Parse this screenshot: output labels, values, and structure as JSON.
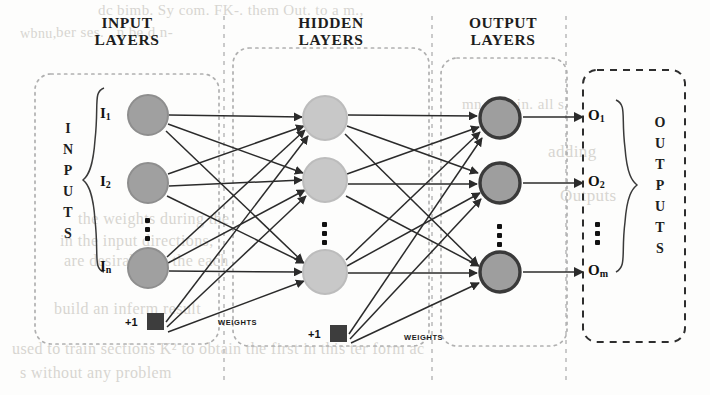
{
  "diagram": {
    "type": "neural-network",
    "background_color": "#fdfdfc",
    "ink_color": "#1d1d1d"
  },
  "headers": {
    "input_layers": "INPUT\nLAYERS",
    "input_layers_line1": "INPUT",
    "input_layers_line2": "LAYERS",
    "hidden_layers_line1": "HIDDEN",
    "hidden_layers_line2": "LAYERS",
    "output_layers_line1": "OUTPUT",
    "output_layers_line2": "LAYERS"
  },
  "sides": {
    "inputs_vertical": [
      "I",
      "N",
      "P",
      "U",
      "T",
      "S"
    ],
    "outputs_vertical": [
      "O",
      "U",
      "T",
      "P",
      "U",
      "T",
      "S"
    ]
  },
  "input_nodes": [
    {
      "label": "I",
      "sub": "1",
      "cx": 148,
      "cy": 115,
      "r": 20
    },
    {
      "label": "I",
      "sub": "2",
      "cx": 148,
      "cy": 183,
      "r": 20
    },
    {
      "label": "I",
      "sub": "n",
      "cx": 148,
      "cy": 268,
      "r": 20
    }
  ],
  "hidden_nodes": [
    {
      "cx": 325,
      "cy": 118,
      "r": 22
    },
    {
      "cx": 325,
      "cy": 180,
      "r": 22
    },
    {
      "cx": 325,
      "cy": 272,
      "r": 22
    }
  ],
  "output_nodes": [
    {
      "label": "O",
      "sub": "1",
      "cx": 500,
      "cy": 118,
      "r": 21
    },
    {
      "label": "O",
      "sub": "2",
      "cx": 500,
      "cy": 183,
      "r": 21
    },
    {
      "label": "O",
      "sub": "m",
      "cx": 500,
      "cy": 272,
      "r": 21
    }
  ],
  "bias_nodes": [
    {
      "label": "+1",
      "x": 147,
      "y": 321,
      "size": 17
    },
    {
      "label": "+1",
      "x": 330,
      "y": 333,
      "size": 17
    }
  ],
  "weights_labels": [
    {
      "text": "WEIGHTS",
      "x": 218,
      "y": 318
    },
    {
      "text": "WEIGHTS",
      "x": 404,
      "y": 333
    }
  ],
  "output_terminal_labels": [
    {
      "label": "O",
      "sub": "1",
      "x": 588,
      "y": 108
    },
    {
      "label": "O",
      "sub": "2",
      "x": 588,
      "y": 173
    },
    {
      "label": "O",
      "sub": "m",
      "x": 588,
      "y": 262
    }
  ],
  "colors": {
    "input_neuron_fill": "#a0a0a0",
    "input_neuron_stroke": "#8c8c8c",
    "hidden_neuron_fill": "#c8c8c8",
    "hidden_neuron_stroke": "#b4b4b4",
    "output_neuron_fill": "#9e9e9e",
    "output_neuron_stroke": "#3a3a3a",
    "bias_fill": "#3d3d3d",
    "connection_stroke": "#2b2b2b",
    "box_dash_light": "#b5b5b5",
    "box_dash_dark": "#2e2e2e",
    "divider_dash": "#bdbdbd",
    "ghost_text": "#b9b5ae"
  },
  "ghost_text": [
    {
      "text": "dc bimb. Sy com. FK-. them Out. to  a  m.,",
      "x": 98,
      "y": 2,
      "size": 15
    },
    {
      "text": "ber ses.     ..n  be      d      n-",
      "x": 56,
      "y": 24,
      "size": 15
    },
    {
      "text": "wbnu,",
      "x": 20,
      "y": 26,
      "size": 14
    },
    {
      "text": "adding",
      "x": 548,
      "y": 142,
      "size": 17
    },
    {
      "text": "the weights during the",
      "x": 78,
      "y": 210,
      "size": 16
    },
    {
      "text": "in the input directions,",
      "x": 60,
      "y": 232,
      "size": 16
    },
    {
      "text": "are desirable in the each",
      "x": 64,
      "y": 252,
      "size": 16
    },
    {
      "text": "build an inferm result",
      "x": 54,
      "y": 300,
      "size": 16
    },
    {
      "text": "used to train sections K² to obtain the first in this ter form ac",
      "x": 12,
      "y": 340,
      "size": 16
    },
    {
      "text": "s without any problem",
      "x": 20,
      "y": 364,
      "size": 16
    },
    {
      "text": "mn nuts in. all s",
      "x": 462,
      "y": 96,
      "size": 15
    },
    {
      "text": "Outputs",
      "x": 560,
      "y": 186,
      "size": 17
    }
  ],
  "dividers": [
    {
      "name": "input-hidden-divider",
      "x": 224
    },
    {
      "name": "hidden-output-divider",
      "x": 432
    },
    {
      "name": "output-outputs-divider",
      "x": 566
    }
  ],
  "boxes": [
    {
      "name": "inputs-box",
      "x": 35,
      "y": 74,
      "w": 184,
      "h": 270,
      "style": "light-dotted"
    },
    {
      "name": "hidden-layers-box",
      "x": 233,
      "y": 48,
      "w": 196,
      "h": 298,
      "style": "light-dotted"
    },
    {
      "name": "output-layers-box",
      "x": 441,
      "y": 58,
      "w": 126,
      "h": 288,
      "style": "light-dotted"
    },
    {
      "name": "outputs-box",
      "x": 583,
      "y": 70,
      "w": 102,
      "h": 272,
      "style": "dark-dashed"
    }
  ]
}
